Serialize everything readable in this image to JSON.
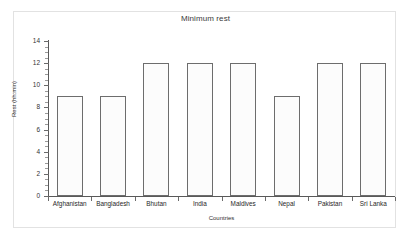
{
  "chart_data": {
    "type": "bar",
    "title": "Minimum rest",
    "xlabel": "Countries",
    "ylabel": "Rest (hh:min)",
    "categories": [
      "Afghanistan",
      "Bangladesh",
      "Bhutan",
      "India",
      "Maldives",
      "Nepal",
      "Pakistan",
      "Sri Lanka"
    ],
    "values": [
      9,
      9,
      12,
      12,
      12,
      9,
      12,
      12
    ],
    "ylim": [
      0,
      14
    ],
    "ytick_labels": [
      "0",
      "2",
      "4",
      "6",
      "8",
      "10",
      "12",
      "14"
    ],
    "ytick_values": [
      0,
      2,
      4,
      6,
      8,
      10,
      12,
      14
    ],
    "yminor_step": 0.5,
    "grid": false,
    "legend": false,
    "legend_position": "none",
    "bar_fill": "#fcfcfc",
    "bar_edge": "#6d6d6d",
    "axis_color": "#595959",
    "frame_color": "#e2e2e2",
    "background": "#ffffff"
  }
}
